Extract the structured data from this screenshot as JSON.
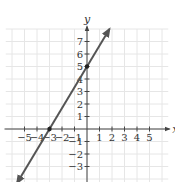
{
  "chart_data": {
    "type": "line",
    "title": "",
    "xlabel": "x",
    "ylabel": "y",
    "xlim": [
      -6.5,
      6.5
    ],
    "ylim": [
      -4,
      8
    ],
    "grid": true,
    "x_ticks": [
      -5,
      -4,
      -3,
      -2,
      -1,
      1,
      2,
      3,
      4,
      5
    ],
    "y_ticks": [
      -3,
      -2,
      -1,
      1,
      2,
      3,
      4,
      5,
      6,
      7
    ],
    "x_tick_labels": [
      "−5",
      "−4",
      "−3",
      "−2",
      "−1",
      "1",
      "2",
      "3",
      "4",
      "5"
    ],
    "y_tick_labels": [
      "−3",
      "−2",
      "−1",
      "1",
      "2",
      "3",
      "4",
      "5",
      "6",
      "7"
    ],
    "series": [
      {
        "name": "line",
        "equation": "y = (5/3)x + 5",
        "slope": 1.6667,
        "intercept": 5,
        "x": [
          -5.6,
          1.8
        ],
        "y": [
          -4.33,
          8.0
        ],
        "arrows": "both"
      }
    ],
    "points": [
      {
        "x": -3,
        "y": 0,
        "label": "x-intercept"
      },
      {
        "x": 0,
        "y": 5,
        "label": "y-intercept"
      }
    ],
    "legend": null
  },
  "colors": {
    "grid": "#e6e6e6",
    "axis": "#444444",
    "line": "#555555",
    "point": "#222222"
  }
}
